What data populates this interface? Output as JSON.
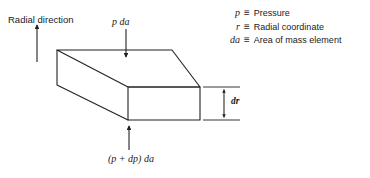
{
  "figure": {
    "type": "free-body-diagram",
    "line_color": "#231f20",
    "text_color": "#1a1a1a",
    "background": "#ffffff"
  },
  "labels": {
    "radial_direction": "Radial direction",
    "top_force": "p da",
    "bottom_force": "(p + dp) da",
    "thickness": "dr"
  },
  "legend": [
    {
      "symbol": "p",
      "relation": "≡",
      "definition": "Pressure"
    },
    {
      "symbol": "r",
      "relation": "≡",
      "definition": "Radial coordinate"
    },
    {
      "symbol": "da",
      "relation": "≡",
      "definition": "Area of mass element"
    }
  ],
  "geometry": {
    "box_front_face": {
      "x": 128,
      "y": 87,
      "width": 72,
      "height": 33
    },
    "depth_offset_x": -71,
    "depth_offset_y": -37,
    "radial_arrow": {
      "x": 37,
      "y_tail": 62,
      "y_head": 25
    },
    "top_arrow": {
      "x": 126,
      "y_tail": 28,
      "y_head": 57
    },
    "bottom_arrow": {
      "x": 129,
      "y_tail": 150,
      "y_head": 125
    },
    "dimension_line_x": 224
  }
}
